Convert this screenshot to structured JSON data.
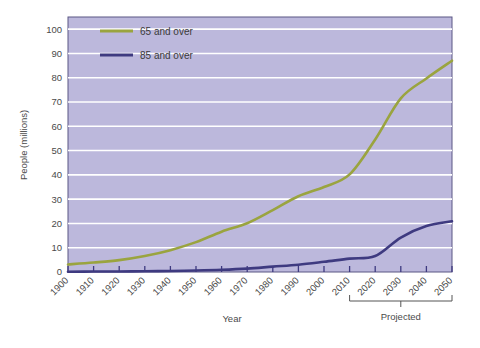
{
  "chart_data": {
    "type": "line",
    "title": "",
    "xlabel": "Year",
    "ylabel": "People (millions)",
    "xlim": [
      1900,
      2050
    ],
    "ylim": [
      0,
      105
    ],
    "yticks": [
      0,
      10,
      20,
      30,
      40,
      50,
      60,
      70,
      80,
      90,
      100
    ],
    "categories": [
      1900,
      1910,
      1920,
      1930,
      1940,
      1950,
      1960,
      1970,
      1980,
      1990,
      2000,
      2010,
      2020,
      2030,
      2040,
      2050
    ],
    "xtick_labels": [
      "1900",
      "1910",
      "1920",
      "1930",
      "1940",
      "1950",
      "1960",
      "1970",
      "1980",
      "1990",
      "2000",
      "2010",
      "2020",
      "2030",
      "2040",
      "2050"
    ],
    "grid": "horizontal",
    "legend_position": "top-left",
    "plot_background": "#bcb8dc",
    "gridline_color": "#ffffff",
    "series": [
      {
        "name": "65 and over",
        "color": "#9aa43f",
        "values": [
          3.1,
          3.9,
          4.9,
          6.6,
          9.0,
          12.3,
          16.6,
          20.1,
          25.5,
          31.2,
          35.0,
          40.2,
          54.6,
          71.5,
          79.7,
          87.0
        ]
      },
      {
        "name": "85 and over",
        "color": "#3e3a80",
        "values": [
          0.1,
          0.2,
          0.2,
          0.3,
          0.4,
          0.6,
          0.9,
          1.4,
          2.2,
          3.0,
          4.2,
          5.5,
          6.6,
          14.2,
          18.9,
          20.9
        ]
      }
    ],
    "annotations": [
      {
        "name": "projected-bracket",
        "label": "Projected",
        "from": 2010,
        "to": 2050
      }
    ]
  },
  "legend": {
    "items": [
      {
        "label": "65 and over",
        "color": "#9aa43f"
      },
      {
        "label": "85 and over",
        "color": "#3e3a80"
      }
    ]
  },
  "labels": {
    "y_axis": "People (millions)",
    "x_axis": "Year",
    "projected": "Projected"
  }
}
